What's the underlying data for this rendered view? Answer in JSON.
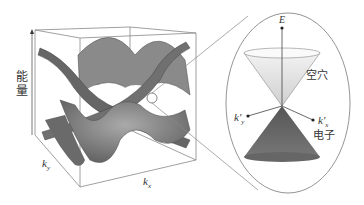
{
  "diagram": {
    "left_panel": {
      "axis_labels": {
        "energy": "能量",
        "ky": "k",
        "ky_sub": "y",
        "kx": "k",
        "kx_sub": "x"
      }
    },
    "right_panel": {
      "axis_labels": {
        "E": "E",
        "ky_prime": "k'",
        "ky_prime_sub": "y",
        "kx_prime": "k'",
        "kx_prime_sub": "x"
      },
      "upper_cone_label": "空穴",
      "lower_cone_label": "电子"
    },
    "colors": {
      "surface_dark": "#555555",
      "surface_mid": "#8a8a8a",
      "surface_light": "#b8b8b8",
      "box_line": "#777777",
      "cone_upper": "#e6e6e6",
      "cone_lower": "#6a6a6a",
      "circle_line": "#8a8a8a"
    }
  }
}
